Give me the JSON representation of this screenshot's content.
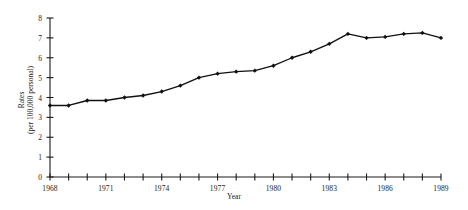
{
  "chart_data": {
    "type": "line",
    "title": "",
    "xlabel": "Year",
    "ylabel": "Rates (per 100,000 personal)",
    "ylabel_line1": "Rates",
    "ylabel_line2": "(per 100,000 personal)",
    "xlim": [
      1968,
      1989
    ],
    "ylim": [
      0,
      8
    ],
    "ytick_step": 1,
    "xtick_step": 1,
    "xtick_label_step": 3,
    "grid": false,
    "legend": "none",
    "marker": "filled-diamond",
    "line_color": "#111111",
    "marker_color": "#111111",
    "axis_color": "#1a1a1a",
    "background": "#ffffff",
    "yticks": [
      0,
      1,
      2,
      3,
      4,
      5,
      6,
      7,
      8
    ],
    "ytick_labels": [
      "0",
      "1",
      "2",
      "3",
      "4",
      "5",
      "6",
      "7",
      "8"
    ],
    "xticks": [
      1968,
      1969,
      1970,
      1971,
      1972,
      1973,
      1974,
      1975,
      1976,
      1977,
      1978,
      1979,
      1980,
      1981,
      1982,
      1983,
      1984,
      1985,
      1986,
      1987,
      1988,
      1989
    ],
    "xtick_labels": [
      "1968",
      "",
      "",
      "1971",
      "",
      "",
      "1974",
      "",
      "",
      "1977",
      "",
      "",
      "1980",
      "",
      "",
      "1983",
      "",
      "",
      "1986",
      "",
      "",
      "1989"
    ],
    "x": [
      1968,
      1969,
      1970,
      1971,
      1972,
      1973,
      1974,
      1975,
      1976,
      1977,
      1978,
      1979,
      1980,
      1981,
      1982,
      1983,
      1984,
      1985,
      1986,
      1987,
      1988,
      1989
    ],
    "values": [
      3.6,
      3.6,
      3.85,
      3.85,
      4.0,
      4.1,
      4.3,
      4.6,
      5.0,
      5.2,
      5.3,
      5.35,
      5.6,
      6.0,
      6.3,
      6.7,
      7.2,
      7.0,
      7.05,
      7.2,
      7.25,
      7.0
    ],
    "series": [
      {
        "name": "Rates",
        "values": [
          3.6,
          3.6,
          3.85,
          3.85,
          4.0,
          4.1,
          4.3,
          4.6,
          5.0,
          5.2,
          5.3,
          5.35,
          5.6,
          6.0,
          6.3,
          6.7,
          7.2,
          7.0,
          7.05,
          7.2,
          7.25,
          7.0
        ]
      }
    ]
  }
}
